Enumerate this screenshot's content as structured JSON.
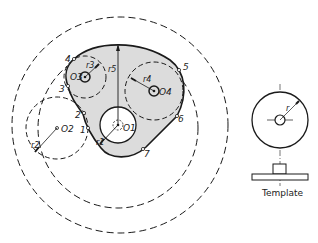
{
  "diagram": {
    "colors": {
      "line": "#1a1a1a",
      "fill": "#dcdcdc",
      "background": "#ffffff"
    },
    "centers": {
      "o1": "O1",
      "o2": "O2",
      "o3": "O3",
      "o4": "O4"
    },
    "radii": {
      "r1": "r1",
      "r2": "r2",
      "r3": "r3",
      "r4": "r4",
      "r5": "r5",
      "r": "r"
    },
    "points": [
      "1",
      "2",
      "3",
      "4",
      "5",
      "6",
      "7"
    ],
    "template": {
      "caption": "Template",
      "radius_label": "r"
    }
  }
}
